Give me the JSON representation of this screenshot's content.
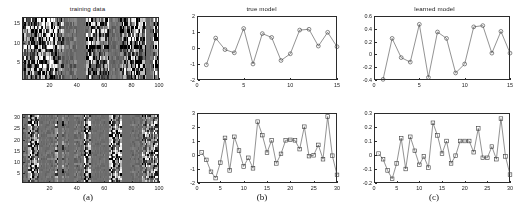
{
  "figure": {
    "captions": [
      {
        "label": "(a)",
        "x": 88,
        "y": 198
      },
      {
        "label": "(b)",
        "x": 262,
        "y": 198
      },
      {
        "label": "(c)",
        "x": 434,
        "y": 198
      }
    ]
  },
  "panels": {
    "a_top": {
      "title": "training data",
      "xticks": [
        "20",
        "40",
        "60",
        "80",
        "100"
      ],
      "xtickvals": [
        20,
        40,
        60,
        80,
        100
      ],
      "yticks": [
        "5",
        "10",
        "15"
      ],
      "ytickvals": [
        5,
        10,
        15
      ],
      "xlim": [
        0,
        100
      ],
      "ylim": [
        0.5,
        16.5
      ]
    },
    "a_bottom": {
      "title": "",
      "xticks": [
        "20",
        "40",
        "60",
        "80",
        "100"
      ],
      "xtickvals": [
        20,
        40,
        60,
        80,
        100
      ],
      "yticks": [
        "5",
        "10",
        "15",
        "20",
        "25",
        "30"
      ],
      "ytickvals": [
        5,
        10,
        15,
        20,
        25,
        30
      ],
      "xlim": [
        0,
        100
      ],
      "ylim": [
        0.5,
        31.5
      ]
    }
  },
  "chart_data": [
    {
      "id": "true-model-top",
      "type": "line",
      "title": "true model",
      "xlabel": "",
      "ylabel": "",
      "xlim": [
        0,
        15
      ],
      "ylim": [
        -2,
        2
      ],
      "xticks": [
        0,
        5,
        10,
        15
      ],
      "yticks": [
        -2,
        -1,
        0,
        1,
        2
      ],
      "grid": false,
      "marker": "circle",
      "legend": null,
      "x": [
        1,
        2,
        3,
        4,
        5,
        6,
        7,
        8,
        9,
        10,
        11,
        12,
        13,
        14,
        15
      ],
      "values": [
        -1.05,
        0.62,
        -0.1,
        -0.3,
        1.22,
        -1.0,
        0.9,
        0.66,
        -0.78,
        -0.36,
        1.12,
        1.17,
        0.12,
        0.98,
        0.08
      ]
    },
    {
      "id": "learned-model-top",
      "type": "line",
      "title": "learned model",
      "xlabel": "",
      "ylabel": "",
      "xlim": [
        0,
        15
      ],
      "ylim": [
        -0.4,
        0.6
      ],
      "xticks": [
        0,
        5,
        10,
        15
      ],
      "yticks": [
        -0.4,
        -0.2,
        0,
        0.2,
        0.4,
        0.6
      ],
      "grid": false,
      "marker": "circle",
      "legend": null,
      "x": [
        1,
        2,
        3,
        4,
        5,
        6,
        7,
        8,
        9,
        10,
        11,
        12,
        13,
        14,
        15
      ],
      "values": [
        -0.39,
        0.25,
        -0.05,
        -0.12,
        0.47,
        -0.36,
        0.35,
        0.25,
        -0.29,
        -0.15,
        0.43,
        0.45,
        0.02,
        0.36,
        0.02
      ]
    },
    {
      "id": "true-model-bottom",
      "type": "line",
      "title": "",
      "xlabel": "",
      "ylabel": "",
      "xlim": [
        0,
        30
      ],
      "ylim": [
        -2,
        3
      ],
      "xticks": [
        0,
        5,
        10,
        15,
        20,
        25,
        30
      ],
      "yticks": [
        -2,
        -1,
        0,
        1,
        2,
        3
      ],
      "grid": false,
      "marker": "square",
      "legend": null,
      "x": [
        1,
        2,
        3,
        4,
        5,
        6,
        7,
        8,
        9,
        10,
        11,
        12,
        13,
        14,
        15,
        16,
        17,
        18,
        19,
        20,
        21,
        22,
        23,
        24,
        25,
        26,
        27,
        28,
        29,
        30
      ],
      "values": [
        0.18,
        -0.35,
        -1.2,
        -1.65,
        -0.55,
        1.22,
        -1.1,
        1.3,
        0.32,
        -0.82,
        -0.2,
        -0.95,
        2.38,
        1.42,
        0.17,
        1.05,
        -0.6,
        0.08,
        1.05,
        1.08,
        1.05,
        0.42,
        2.02,
        -0.08,
        -0.02,
        0.72,
        -0.3,
        2.75,
        -0.05,
        -1.42
      ]
    },
    {
      "id": "learned-model-bottom",
      "type": "line",
      "title": "",
      "xlabel": "",
      "ylabel": "",
      "xlim": [
        0,
        30
      ],
      "ylim": [
        -0.2,
        0.3
      ],
      "xticks": [
        0,
        5,
        10,
        15,
        20,
        25,
        30
      ],
      "yticks": [
        -0.2,
        -0.1,
        0,
        0.1,
        0.2,
        0.3
      ],
      "grid": false,
      "marker": "square",
      "legend": null,
      "x": [
        1,
        2,
        3,
        4,
        5,
        6,
        7,
        8,
        9,
        10,
        11,
        12,
        13,
        14,
        15,
        16,
        17,
        18,
        19,
        20,
        21,
        22,
        23,
        24,
        25,
        26,
        27,
        28,
        29,
        30
      ],
      "values": [
        0.01,
        -0.03,
        -0.11,
        -0.17,
        -0.06,
        0.12,
        -0.1,
        0.13,
        0.03,
        -0.07,
        -0.01,
        -0.09,
        0.23,
        0.14,
        0.01,
        0.1,
        -0.06,
        -0.005,
        0.1,
        0.1,
        0.1,
        0.02,
        0.19,
        -0.02,
        -0.02,
        0.06,
        -0.03,
        0.26,
        -0.01,
        -0.14
      ]
    },
    {
      "id": "training-data-top-heatmap",
      "type": "heatmap",
      "title": "training data",
      "xlabel": "",
      "ylabel": "",
      "rows": 16,
      "cols": 100,
      "xticks": [
        20,
        40,
        60,
        80,
        100
      ],
      "yticks": [
        5,
        10,
        15
      ],
      "colormap": "gray"
    },
    {
      "id": "training-data-bottom-heatmap",
      "type": "heatmap",
      "title": "",
      "xlabel": "",
      "ylabel": "",
      "rows": 31,
      "cols": 100,
      "xticks": [
        20,
        40,
        60,
        80,
        100
      ],
      "yticks": [
        5,
        10,
        15,
        20,
        25,
        30
      ],
      "colormap": "gray"
    }
  ]
}
